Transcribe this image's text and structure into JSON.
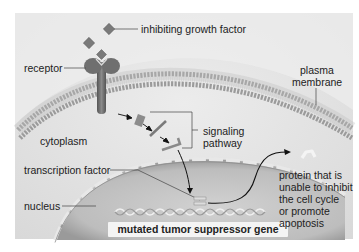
{
  "figure": {
    "labels": {
      "inhibiting_growth_factor": "inhibiting growth factor",
      "receptor": "receptor",
      "plasma_membrane_line1": "plasma",
      "plasma_membrane_line2": "membrane",
      "cytoplasm": "cytoplasm",
      "signaling_pathway_line1": "signaling",
      "signaling_pathway_line2": "pathway",
      "transcription_factor": "transcription factor",
      "nucleus": "nucleus",
      "mutated_gene": "mutated tumor suppressor gene",
      "protein_line1": "protein that is",
      "protein_line2": "unable to inhibit",
      "protein_line3": "the cell cycle",
      "protein_line4": "or promote",
      "protein_line5": "apoptosis"
    },
    "colors": {
      "background": "#e2e2e2",
      "membrane_head": "#8a8a8a",
      "receptor": "#6e6e6e",
      "growth_factor": "#777777",
      "nucleus": "#c4c4c4",
      "text": "#222222"
    }
  }
}
